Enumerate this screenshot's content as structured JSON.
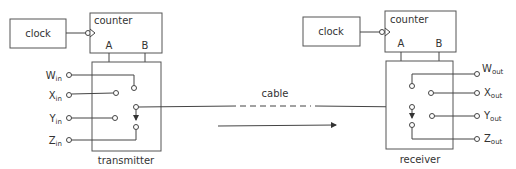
{
  "colors": {
    "line": "#444444",
    "box": "#555555",
    "text": "#333333",
    "background": "#ffffff"
  },
  "transmitter_side": {
    "clock_label": "clock",
    "counter_label": "counter",
    "counter_outputs": {
      "a": "A",
      "b": "B"
    },
    "unit_label": "transmitter",
    "inputs": [
      {
        "letter": "W",
        "sub": "in"
      },
      {
        "letter": "X",
        "sub": "in"
      },
      {
        "letter": "Y",
        "sub": "in"
      },
      {
        "letter": "Z",
        "sub": "in"
      }
    ]
  },
  "link": {
    "cable_label": "cable",
    "direction": "left-to-right"
  },
  "receiver_side": {
    "clock_label": "clock",
    "counter_label": "counter",
    "counter_outputs": {
      "a": "A",
      "b": "B"
    },
    "unit_label": "receiver",
    "outputs": [
      {
        "letter": "W",
        "sub": "out"
      },
      {
        "letter": "X",
        "sub": "out"
      },
      {
        "letter": "Y",
        "sub": "out"
      },
      {
        "letter": "Z",
        "sub": "out"
      }
    ]
  }
}
